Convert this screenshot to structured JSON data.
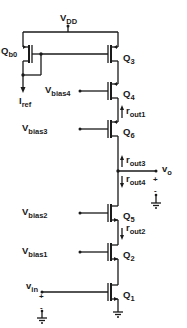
{
  "diagram": {
    "supply": {
      "label": "V",
      "sub": "DD"
    },
    "transistors": [
      {
        "id": "Qb0",
        "label": "Q",
        "sub": "b0",
        "type": "pmos"
      },
      {
        "id": "Q3",
        "label": "Q",
        "sub": "3",
        "type": "pmos"
      },
      {
        "id": "Q4",
        "label": "Q",
        "sub": "4",
        "type": "pmos"
      },
      {
        "id": "Q6",
        "label": "Q",
        "sub": "6",
        "type": "pmos"
      },
      {
        "id": "Q5",
        "label": "Q",
        "sub": "5",
        "type": "nmos"
      },
      {
        "id": "Q2",
        "label": "Q",
        "sub": "2",
        "type": "nmos"
      },
      {
        "id": "Q1",
        "label": "Q",
        "sub": "1",
        "type": "nmos"
      }
    ],
    "bias": [
      {
        "id": "vbias4",
        "label": "V",
        "sub": "bias4"
      },
      {
        "id": "vbias3",
        "label": "V",
        "sub": "bias3"
      },
      {
        "id": "vbias2",
        "label": "V",
        "sub": "bias2"
      },
      {
        "id": "vbias1",
        "label": "V",
        "sub": "bias1"
      }
    ],
    "resistances": [
      {
        "id": "rout1",
        "label": "r",
        "sub": "out1",
        "direction": "up"
      },
      {
        "id": "rout3",
        "label": "r",
        "sub": "out3",
        "direction": "up"
      },
      {
        "id": "rout4",
        "label": "r",
        "sub": "out4",
        "direction": "down"
      },
      {
        "id": "rout2",
        "label": "r",
        "sub": "out2",
        "direction": "down"
      }
    ],
    "iref": {
      "label": "I",
      "sub": "ref"
    },
    "output": {
      "label": "v",
      "sub": "o",
      "plus": "+",
      "minus": "-"
    },
    "input": {
      "label": "v",
      "sub": "in",
      "plus": "+",
      "minus": "-"
    }
  }
}
